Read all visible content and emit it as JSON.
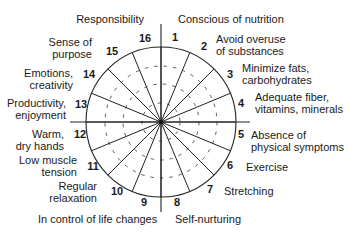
{
  "diagram": {
    "type": "wellness-wheel",
    "segments": [
      {
        "n": "1",
        "label": [
          "Conscious of nutrition"
        ]
      },
      {
        "n": "2",
        "label": [
          "Avoid overuse",
          "of substances"
        ]
      },
      {
        "n": "3",
        "label": [
          "Minimize fats,",
          "carbohydrates"
        ]
      },
      {
        "n": "4",
        "label": [
          "Adequate fiber,",
          "vitamins, minerals"
        ]
      },
      {
        "n": "5",
        "label": [
          "Absence of",
          "physical symptoms"
        ]
      },
      {
        "n": "6",
        "label": [
          "Exercise"
        ]
      },
      {
        "n": "7",
        "label": [
          "Stretching"
        ]
      },
      {
        "n": "8",
        "label": [
          "Self-nurturing"
        ]
      },
      {
        "n": "9",
        "label": [
          "In control of life changes"
        ]
      },
      {
        "n": "10",
        "label": [
          "Regular",
          "relaxation"
        ]
      },
      {
        "n": "11",
        "label": [
          "Low muscle",
          "tension"
        ]
      },
      {
        "n": "12",
        "label": [
          "Warm,",
          "dry hands"
        ]
      },
      {
        "n": "13",
        "label": [
          "Productivity,",
          "enjoyment"
        ]
      },
      {
        "n": "14",
        "label": [
          "Emotions,",
          "creativity"
        ]
      },
      {
        "n": "15",
        "label": [
          "Sense of",
          "purpose"
        ]
      },
      {
        "n": "16",
        "label": [
          "Responsibility"
        ]
      }
    ]
  }
}
